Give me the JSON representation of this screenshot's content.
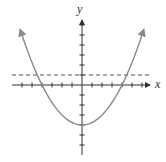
{
  "figure": {
    "x_label": "x",
    "y_label": "y",
    "curve_color": "#8a8a8a",
    "axis_color": "#333333",
    "dashed_color": "#555555"
  },
  "chart_data": {
    "type": "line",
    "title": "",
    "xlabel": "x",
    "ylabel": "y",
    "xlim": [
      -6,
      6
    ],
    "ylim": [
      -6,
      7
    ],
    "grid": false,
    "series": [
      {
        "name": "parabola",
        "function": "y = x^2/4 - 4",
        "vertex": [
          0,
          -4
        ],
        "x_intercepts": [
          -4,
          4
        ],
        "style": "solid"
      },
      {
        "name": "horizontal line",
        "function": "y = 1",
        "style": "dashed"
      }
    ],
    "intersections": [
      [
        -4.47,
        1
      ],
      [
        4.47,
        1
      ]
    ]
  }
}
